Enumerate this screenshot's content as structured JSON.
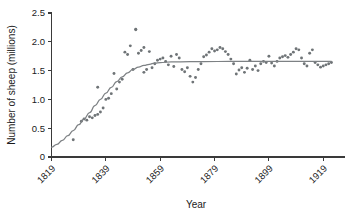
{
  "chart_data": {
    "type": "scatter",
    "title": "",
    "xlabel": "Year",
    "ylabel": "Number of sheep (millions)",
    "xlim": [
      1819,
      1927
    ],
    "ylim": [
      0,
      2.5
    ],
    "grid": false,
    "legend": "none",
    "xticks": [
      1819,
      1839,
      1859,
      1879,
      1899,
      1919
    ],
    "xtick_labels": [
      "1819",
      "1839",
      "1859",
      "1879",
      "1899",
      "1919"
    ],
    "yticks": [
      0,
      0.5,
      1.0,
      1.5,
      2.0,
      2.5
    ],
    "ytick_labels": [
      "0",
      "0.5",
      "1.0",
      "1.5",
      "2.0",
      "2.5"
    ],
    "series": [
      {
        "name": "Observed sheep population",
        "marker": "circle",
        "color": "#6f7477",
        "points": [
          [
            1827,
            0.3
          ],
          [
            1830,
            0.62
          ],
          [
            1831,
            0.66
          ],
          [
            1832,
            0.64
          ],
          [
            1833,
            0.7
          ],
          [
            1834,
            0.68
          ],
          [
            1835,
            0.72
          ],
          [
            1836,
            0.74
          ],
          [
            1837,
            0.78
          ],
          [
            1836,
            1.21
          ],
          [
            1838,
            0.85
          ],
          [
            1839,
            1.0
          ],
          [
            1840,
            1.02
          ],
          [
            1841,
            1.1
          ],
          [
            1842,
            1.45
          ],
          [
            1843,
            1.18
          ],
          [
            1844,
            1.3
          ],
          [
            1845,
            1.35
          ],
          [
            1846,
            1.82
          ],
          [
            1847,
            1.78
          ],
          [
            1848,
            1.93
          ],
          [
            1849,
            1.52
          ],
          [
            1850,
            2.22
          ],
          [
            1850,
            2.21
          ],
          [
            1851,
            1.8
          ],
          [
            1852,
            1.85
          ],
          [
            1853,
            1.47
          ],
          [
            1853,
            1.9
          ],
          [
            1854,
            1.52
          ],
          [
            1855,
            1.83
          ],
          [
            1856,
            1.55
          ],
          [
            1857,
            1.62
          ],
          [
            1858,
            1.68
          ],
          [
            1859,
            1.7
          ],
          [
            1860,
            1.72
          ],
          [
            1861,
            1.66
          ],
          [
            1862,
            1.6
          ],
          [
            1863,
            1.75
          ],
          [
            1864,
            1.57
          ],
          [
            1865,
            1.78
          ],
          [
            1866,
            1.72
          ],
          [
            1867,
            1.52
          ],
          [
            1868,
            1.48
          ],
          [
            1869,
            1.55
          ],
          [
            1870,
            1.4
          ],
          [
            1871,
            1.3
          ],
          [
            1872,
            1.38
          ],
          [
            1873,
            1.52
          ],
          [
            1874,
            1.62
          ],
          [
            1875,
            1.74
          ],
          [
            1876,
            1.77
          ],
          [
            1877,
            1.82
          ],
          [
            1878,
            1.88
          ],
          [
            1879,
            1.84
          ],
          [
            1880,
            1.86
          ],
          [
            1881,
            1.9
          ],
          [
            1882,
            1.88
          ],
          [
            1883,
            1.83
          ],
          [
            1884,
            1.78
          ],
          [
            1885,
            1.7
          ],
          [
            1886,
            1.62
          ],
          [
            1887,
            1.44
          ],
          [
            1888,
            1.51
          ],
          [
            1889,
            1.55
          ],
          [
            1890,
            1.47
          ],
          [
            1891,
            1.54
          ],
          [
            1892,
            1.68
          ],
          [
            1893,
            1.52
          ],
          [
            1894,
            1.58
          ],
          [
            1895,
            1.5
          ],
          [
            1896,
            1.62
          ],
          [
            1897,
            1.66
          ],
          [
            1898,
            1.64
          ],
          [
            1899,
            1.75
          ],
          [
            1900,
            1.63
          ],
          [
            1901,
            1.58
          ],
          [
            1902,
            1.66
          ],
          [
            1903,
            1.72
          ],
          [
            1904,
            1.74
          ],
          [
            1905,
            1.76
          ],
          [
            1906,
            1.73
          ],
          [
            1907,
            1.78
          ],
          [
            1908,
            1.82
          ],
          [
            1909,
            1.88
          ],
          [
            1910,
            1.86
          ],
          [
            1911,
            1.72
          ],
          [
            1912,
            1.62
          ],
          [
            1913,
            1.58
          ],
          [
            1914,
            1.8
          ],
          [
            1915,
            1.86
          ],
          [
            1916,
            1.64
          ],
          [
            1917,
            1.6
          ],
          [
            1918,
            1.56
          ],
          [
            1919,
            1.58
          ],
          [
            1920,
            1.6
          ],
          [
            1921,
            1.62
          ],
          [
            1922,
            1.64
          ]
        ]
      }
    ],
    "fit_curve": {
      "name": "Logistic growth fit",
      "color": "#7d8184",
      "points": [
        [
          1819,
          0.17
        ],
        [
          1821,
          0.22
        ],
        [
          1823,
          0.29
        ],
        [
          1825,
          0.37
        ],
        [
          1827,
          0.46
        ],
        [
          1829,
          0.56
        ],
        [
          1831,
          0.66
        ],
        [
          1833,
          0.77
        ],
        [
          1835,
          0.89
        ],
        [
          1837,
          1.0
        ],
        [
          1839,
          1.11
        ],
        [
          1841,
          1.21
        ],
        [
          1843,
          1.31
        ],
        [
          1845,
          1.39
        ],
        [
          1847,
          1.46
        ],
        [
          1849,
          1.52
        ],
        [
          1851,
          1.56
        ],
        [
          1853,
          1.59
        ],
        [
          1855,
          1.61
        ],
        [
          1857,
          1.63
        ],
        [
          1859,
          1.64
        ],
        [
          1863,
          1.65
        ],
        [
          1870,
          1.655
        ],
        [
          1880,
          1.658
        ],
        [
          1890,
          1.659
        ],
        [
          1900,
          1.66
        ],
        [
          1910,
          1.66
        ],
        [
          1918,
          1.66
        ],
        [
          1922,
          1.66
        ]
      ]
    }
  },
  "axis": {
    "x_title": "Year",
    "y_title": "Number of sheep (millions)"
  }
}
